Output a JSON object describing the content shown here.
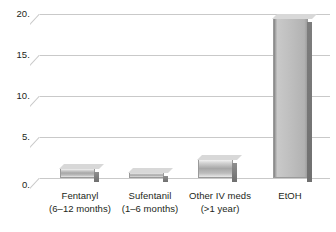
{
  "chart_data": {
    "type": "bar",
    "title": "",
    "subtitle": "",
    "xlabel": "",
    "ylabel": "",
    "ylim": [
      0,
      20
    ],
    "ytick_labels": [
      "0.",
      "5.",
      "10.",
      "15.",
      "20."
    ],
    "ytick_values": [
      0,
      5,
      10,
      15,
      20
    ],
    "grid": true,
    "legend": null,
    "style": "3d-bar",
    "categories": [
      "Fentanyl (6–12 months)",
      "Sufentanil (1–6 months)",
      "Other IV meds (>1 year)",
      "EtOH"
    ],
    "values": [
      1.2,
      0.7,
      2.3,
      19.5
    ],
    "colors": {
      "bar_light": "#d2d2d2",
      "bar_mid": "#a7a7a7",
      "bar_dark": "#6f6f6f",
      "gridline": "#c9c9c9",
      "text": "#231f20",
      "background": "#ffffff"
    }
  },
  "axis": {
    "y_ticks": [
      {
        "label": "20."
      },
      {
        "label": "15."
      },
      {
        "label": "10."
      },
      {
        "label": "5."
      },
      {
        "label": "0."
      }
    ]
  },
  "categories": [
    {
      "line1": "Fentanyl",
      "line2": "(6–12 months)"
    },
    {
      "line1": "Sufentanil",
      "line2": "(1–6 months)"
    },
    {
      "line1": "Other IV meds",
      "line2": "(>1 year)"
    },
    {
      "line1": "EtOH",
      "line2": ""
    }
  ]
}
